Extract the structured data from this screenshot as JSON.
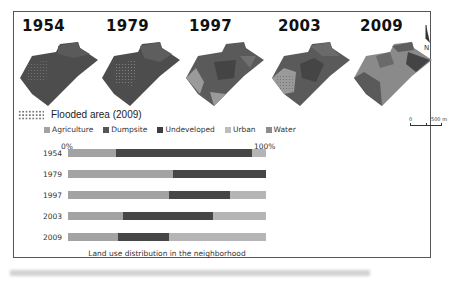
{
  "figure": {
    "years": [
      "1954",
      "1979",
      "1997",
      "2003",
      "2009"
    ],
    "flood_legend": "Flooded area (2009)",
    "scale": {
      "start": "0",
      "end": "500 m"
    },
    "north_label": "N"
  },
  "colors": {
    "Agriculture": "#a3a3a3",
    "Dumpsite": "#555555",
    "Undeveloped": "#464646",
    "Urban": "#b3b3b3",
    "Water": "#8c8c8c",
    "map_dark": "#4d4d4d",
    "map_mid": "#6a6a6a",
    "map_light": "#9a9a9a"
  },
  "chart_data": {
    "type": "bar",
    "orientation": "horizontal-stacked-100",
    "title": "Land use distribution in the neighborhood",
    "xlabel": "",
    "ylabel": "",
    "x_ticks": [
      "0%",
      "100%"
    ],
    "xlim": [
      0,
      100
    ],
    "legend": [
      "Agriculture",
      "Dumpsite",
      "Undeveloped",
      "Urban",
      "Water"
    ],
    "legend_position": "top",
    "grid": false,
    "categories": [
      "1954",
      "1979",
      "1997",
      "2003",
      "2009"
    ],
    "series": [
      {
        "name": "Agriculture",
        "values": [
          24,
          53,
          51,
          28,
          25
        ]
      },
      {
        "name": "Undeveloped",
        "values": [
          69,
          47,
          31,
          45,
          26
        ]
      },
      {
        "name": "Urban",
        "values": [
          7,
          0,
          18,
          27,
          49
        ]
      }
    ]
  },
  "legend_items": [
    {
      "label": "Agriculture",
      "color": "#a3a3a3"
    },
    {
      "label": "Dumpsite",
      "color": "#555555"
    },
    {
      "label": "Undeveloped",
      "color": "#3e3e3e"
    },
    {
      "label": "Urban",
      "color": "#bdbdbd"
    },
    {
      "label": "Water",
      "color": "#8c8c8c"
    }
  ],
  "axis": {
    "min_label": "0%",
    "max_label": "100%"
  }
}
